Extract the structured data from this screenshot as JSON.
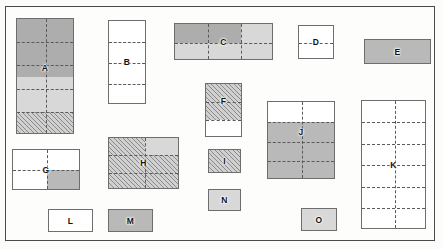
{
  "diagram": {
    "canvas": {
      "width": 442,
      "height": 249,
      "background": "#fcfcfb"
    },
    "frame": {
      "x": 5,
      "y": 6,
      "width": 430,
      "height": 235,
      "border_color": "#4a4a4a"
    },
    "palette": {
      "white": "#ffffff",
      "gray": "#b9b9b9",
      "dark_gray": "#adadad",
      "light_gray": "#d8d8d8",
      "hatch_line": "#8a8a8a",
      "outline": "#6e6e6e",
      "label_text": "#111111"
    },
    "blocks": [
      {
        "id": "A",
        "label": "A",
        "x": 15,
        "y": 17,
        "w": 58,
        "h": 116,
        "fill": "dark-light-hatch",
        "rows": 5,
        "cols": 2
      },
      {
        "id": "B",
        "label": "B",
        "x": 107,
        "y": 19,
        "w": 38,
        "h": 84,
        "fill": "white",
        "rows": 4,
        "cols": 1
      },
      {
        "id": "C",
        "label": "C",
        "x": 173,
        "y": 22,
        "w": 99,
        "h": 37,
        "fill": "dark-light",
        "rows": 2,
        "cols": 3
      },
      {
        "id": "D",
        "label": "D",
        "x": 297,
        "y": 24,
        "w": 36,
        "h": 34,
        "fill": "white",
        "rows": 2,
        "cols": 1
      },
      {
        "id": "E",
        "label": "E",
        "x": 363,
        "y": 38,
        "w": 67,
        "h": 25,
        "fill": "gray",
        "rows": 1,
        "cols": 1
      },
      {
        "id": "F",
        "label": "F",
        "x": 204,
        "y": 82,
        "w": 37,
        "h": 54,
        "fill": "hatch-white",
        "rows": 3,
        "cols": 1
      },
      {
        "id": "G",
        "label": "G",
        "x": 11,
        "y": 148,
        "w": 68,
        "h": 41,
        "fill": "white-quadrant",
        "rows": 2,
        "cols": 2
      },
      {
        "id": "H",
        "label": "H",
        "x": 107,
        "y": 136,
        "w": 71,
        "h": 52,
        "fill": "hatch-patch",
        "rows": 3,
        "cols": 2
      },
      {
        "id": "I",
        "label": "I",
        "x": 207,
        "y": 148,
        "w": 33,
        "h": 24,
        "fill": "hatch",
        "rows": 1,
        "cols": 1
      },
      {
        "id": "J",
        "label": "J",
        "x": 266,
        "y": 100,
        "w": 68,
        "h": 78,
        "fill": "white-gray",
        "rows": 4,
        "cols": 2
      },
      {
        "id": "K",
        "label": "K",
        "x": 360,
        "y": 99,
        "w": 65,
        "h": 129,
        "fill": "white",
        "rows": 6,
        "cols": 2
      },
      {
        "id": "L",
        "label": "L",
        "x": 47,
        "y": 208,
        "w": 45,
        "h": 23,
        "fill": "white",
        "rows": 1,
        "cols": 1
      },
      {
        "id": "M",
        "label": "M",
        "x": 107,
        "y": 208,
        "w": 45,
        "h": 23,
        "fill": "gray",
        "rows": 1,
        "cols": 1
      },
      {
        "id": "N",
        "label": "N",
        "x": 207,
        "y": 188,
        "w": 33,
        "h": 22,
        "fill": "gray",
        "rows": 1,
        "cols": 1
      },
      {
        "id": "O",
        "label": "O",
        "x": 300,
        "y": 207,
        "w": 36,
        "h": 23,
        "fill": "gray",
        "rows": 1,
        "cols": 1
      }
    ]
  }
}
